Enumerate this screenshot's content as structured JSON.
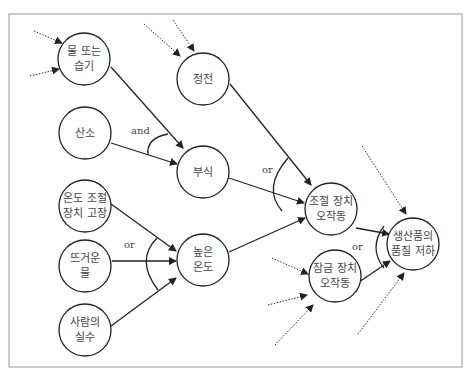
{
  "diagram": {
    "type": "fault-tree / cause-effect",
    "nodes": [
      {
        "id": "water",
        "line1": "물 또는",
        "line2": "습기",
        "cx": 84,
        "cy": 59
      },
      {
        "id": "power",
        "line1": "정전",
        "line2": "",
        "cx": 203,
        "cy": 79
      },
      {
        "id": "oxygen",
        "line1": "산소",
        "line2": "",
        "cx": 85,
        "cy": 133
      },
      {
        "id": "corrosion",
        "line1": "부식",
        "line2": "",
        "cx": 203,
        "cy": 172
      },
      {
        "id": "thermostat",
        "line1": "온도 조절",
        "line2": "장치 고장",
        "cx": 85,
        "cy": 206
      },
      {
        "id": "hotwater",
        "line1": "뜨거운",
        "line2": "물",
        "cx": 85,
        "cy": 266
      },
      {
        "id": "hightemp",
        "line1": "높은",
        "line2": "온도",
        "cx": 203,
        "cy": 260
      },
      {
        "id": "human",
        "line1": "사람의",
        "line2": "실수",
        "cx": 85,
        "cy": 330
      },
      {
        "id": "control",
        "line1": "조절 장치",
        "line2": "오작동",
        "cx": 331,
        "cy": 209
      },
      {
        "id": "lock",
        "line1": "잠금 장치",
        "line2": "오작동",
        "cx": 335,
        "cy": 276
      },
      {
        "id": "quality",
        "line1": "생산품의",
        "line2": "품질 저하",
        "cx": 413,
        "cy": 244
      }
    ],
    "gates": [
      {
        "label": "and",
        "x": 131,
        "y": 125
      },
      {
        "label": "or",
        "x": 264,
        "y": 166
      },
      {
        "label": "or",
        "x": 124,
        "y": 247
      },
      {
        "label": "or",
        "x": 353,
        "y": 245
      }
    ]
  }
}
